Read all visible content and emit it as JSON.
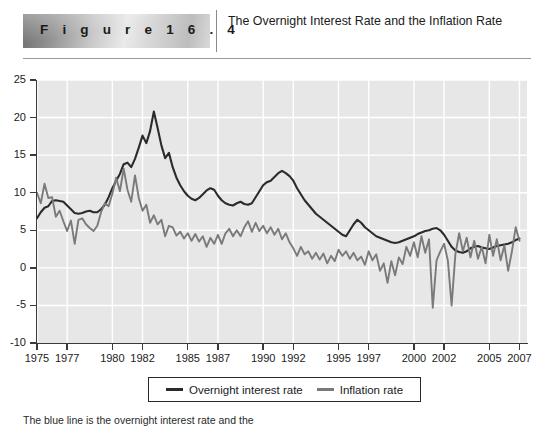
{
  "header": {
    "figure_label": "F i g u r e   1 6 . 4",
    "title": "The Overnight Interest Rate and the Inflation Rate"
  },
  "caption": "The blue line is the overnight interest rate and the",
  "legend": {
    "position": "bottom",
    "items": [
      {
        "label": "Overnight interest rate",
        "color": "#2b2b2b"
      },
      {
        "label": "Inflation rate",
        "color": "#7a7a7a"
      }
    ]
  },
  "colors": {
    "plot_background": "#e7e7e7",
    "gridline": "#ffffff",
    "axis": "#3a3a3a",
    "overnight_rate": "#2b2b2b",
    "inflation_rate": "#7a7a7a"
  },
  "chart_data": {
    "type": "line",
    "title": "The Overnight Interest Rate and the Inflation Rate",
    "xlabel": "",
    "ylabel": "",
    "xlim": [
      1975,
      2007.5
    ],
    "ylim": [
      -10,
      25
    ],
    "grid": true,
    "yticks": [
      25,
      20,
      15,
      10,
      5,
      0,
      -5,
      -10
    ],
    "ytick_labels": [
      "25",
      "20",
      "15",
      "10",
      "5",
      "0",
      "-5",
      "-10"
    ],
    "xticks": [
      1975,
      1977,
      1980,
      1982,
      1985,
      1987,
      1990,
      1992,
      1995,
      1997,
      2000,
      2002,
      2005,
      2007
    ],
    "xtick_labels": [
      "1975",
      "1977",
      "1980",
      "1982",
      "1985",
      "1987",
      "1990",
      "1992",
      "1995",
      "1997",
      "2000",
      "2002",
      "2005",
      "2007"
    ],
    "series": [
      {
        "name": "Overnight interest rate",
        "color": "#2b2b2b",
        "x": [
          1975.0,
          1975.25,
          1975.5,
          1975.75,
          1976.0,
          1976.25,
          1976.5,
          1976.75,
          1977.0,
          1977.25,
          1977.5,
          1977.75,
          1978.0,
          1978.25,
          1978.5,
          1978.75,
          1979.0,
          1979.25,
          1979.5,
          1979.75,
          1980.0,
          1980.25,
          1980.5,
          1980.75,
          1981.0,
          1981.25,
          1981.5,
          1981.75,
          1982.0,
          1982.25,
          1982.5,
          1982.75,
          1983.0,
          1983.25,
          1983.5,
          1983.75,
          1984.0,
          1984.25,
          1984.5,
          1984.75,
          1985.0,
          1985.25,
          1985.5,
          1985.75,
          1986.0,
          1986.25,
          1986.5,
          1986.75,
          1987.0,
          1987.25,
          1987.5,
          1987.75,
          1988.0,
          1988.25,
          1988.5,
          1988.75,
          1989.0,
          1989.25,
          1989.5,
          1989.75,
          1990.0,
          1990.25,
          1990.5,
          1990.75,
          1991.0,
          1991.25,
          1991.5,
          1991.75,
          1992.0,
          1992.25,
          1992.5,
          1992.75,
          1993.0,
          1993.25,
          1993.5,
          1993.75,
          1994.0,
          1994.25,
          1994.5,
          1994.75,
          1995.0,
          1995.25,
          1995.5,
          1995.75,
          1996.0,
          1996.25,
          1996.5,
          1996.75,
          1997.0,
          1997.25,
          1997.5,
          1997.75,
          1998.0,
          1998.25,
          1998.5,
          1998.75,
          1999.0,
          1999.25,
          1999.5,
          1999.75,
          2000.0,
          2000.25,
          2000.5,
          2000.75,
          2001.0,
          2001.25,
          2001.5,
          2001.75,
          2002.0,
          2002.25,
          2002.5,
          2002.75,
          2003.0,
          2003.25,
          2003.5,
          2003.75,
          2004.0,
          2004.25,
          2004.5,
          2004.75,
          2005.0,
          2005.25,
          2005.5,
          2005.75,
          2006.0,
          2006.25,
          2006.5,
          2006.75,
          2007.0
        ],
        "y": [
          6.6,
          7.4,
          8.0,
          8.2,
          8.9,
          9.0,
          8.9,
          8.8,
          8.3,
          7.8,
          7.3,
          7.2,
          7.3,
          7.5,
          7.6,
          7.4,
          7.4,
          7.8,
          8.4,
          9.4,
          10.6,
          11.6,
          12.5,
          13.8,
          14.0,
          13.4,
          14.5,
          16.0,
          17.6,
          16.6,
          18.2,
          20.8,
          18.6,
          16.3,
          14.6,
          15.3,
          13.4,
          12.0,
          11.0,
          10.2,
          9.6,
          9.2,
          9.0,
          9.3,
          9.8,
          10.3,
          10.6,
          10.4,
          9.6,
          9.0,
          8.6,
          8.4,
          8.3,
          8.6,
          8.8,
          8.5,
          8.4,
          8.6,
          9.4,
          10.2,
          11.0,
          11.4,
          11.6,
          12.1,
          12.6,
          12.9,
          12.6,
          12.2,
          11.6,
          10.6,
          9.8,
          9.0,
          8.4,
          7.8,
          7.2,
          6.8,
          6.4,
          6.0,
          5.6,
          5.2,
          4.8,
          4.4,
          4.2,
          5.0,
          5.8,
          6.4,
          6.0,
          5.4,
          5.0,
          4.6,
          4.2,
          4.0,
          3.8,
          3.6,
          3.4,
          3.3,
          3.4,
          3.6,
          3.8,
          4.0,
          4.2,
          4.5,
          4.7,
          4.9,
          5.0,
          5.2,
          5.3,
          5.0,
          4.4,
          3.6,
          2.8,
          2.3,
          2.1,
          2.0,
          2.2,
          2.6,
          2.8,
          2.9,
          2.7,
          2.6,
          2.5,
          2.7,
          2.9,
          3.0,
          3.1,
          3.2,
          3.4,
          3.7,
          3.9
        ]
      },
      {
        "name": "Inflation rate",
        "color": "#7a7a7a",
        "x": [
          1975.0,
          1975.25,
          1975.5,
          1975.75,
          1976.0,
          1976.25,
          1976.5,
          1976.75,
          1977.0,
          1977.25,
          1977.5,
          1977.75,
          1978.0,
          1978.25,
          1978.5,
          1978.75,
          1979.0,
          1979.25,
          1979.5,
          1979.75,
          1980.0,
          1980.25,
          1980.5,
          1980.75,
          1981.0,
          1981.25,
          1981.5,
          1981.75,
          1982.0,
          1982.25,
          1982.5,
          1982.75,
          1983.0,
          1983.25,
          1983.5,
          1983.75,
          1984.0,
          1984.25,
          1984.5,
          1984.75,
          1985.0,
          1985.25,
          1985.5,
          1985.75,
          1986.0,
          1986.25,
          1986.5,
          1986.75,
          1987.0,
          1987.25,
          1987.5,
          1987.75,
          1988.0,
          1988.25,
          1988.5,
          1988.75,
          1989.0,
          1989.25,
          1989.5,
          1989.75,
          1990.0,
          1990.25,
          1990.5,
          1990.75,
          1991.0,
          1991.25,
          1991.5,
          1991.75,
          1992.0,
          1992.25,
          1992.5,
          1992.75,
          1993.0,
          1993.25,
          1993.5,
          1993.75,
          1994.0,
          1994.25,
          1994.5,
          1994.75,
          1995.0,
          1995.25,
          1995.5,
          1995.75,
          1996.0,
          1996.25,
          1996.5,
          1996.75,
          1997.0,
          1997.25,
          1997.5,
          1997.75,
          1998.0,
          1998.25,
          1998.5,
          1998.75,
          1999.0,
          1999.25,
          1999.5,
          1999.75,
          2000.0,
          2000.25,
          2000.5,
          2000.75,
          2001.0,
          2001.25,
          2001.5,
          2001.75,
          2002.0,
          2002.25,
          2002.5,
          2002.75,
          2003.0,
          2003.25,
          2003.5,
          2003.75,
          2004.0,
          2004.25,
          2004.5,
          2004.75,
          2005.0,
          2005.25,
          2005.5,
          2005.75,
          2006.0,
          2006.25,
          2006.5,
          2006.75,
          2007.0
        ],
        "y": [
          10.0,
          8.6,
          11.2,
          9.3,
          9.4,
          6.8,
          7.6,
          6.2,
          4.9,
          6.3,
          3.2,
          6.4,
          6.6,
          5.8,
          5.3,
          4.9,
          5.6,
          7.4,
          8.6,
          8.2,
          9.9,
          12.0,
          10.2,
          13.2,
          10.4,
          8.8,
          12.3,
          9.3,
          7.6,
          8.4,
          6.0,
          7.0,
          5.8,
          6.4,
          4.2,
          5.6,
          5.4,
          4.3,
          4.8,
          3.9,
          4.6,
          3.6,
          4.5,
          3.5,
          4.2,
          2.8,
          4.0,
          3.2,
          4.4,
          3.2,
          4.6,
          5.2,
          4.2,
          5.0,
          4.2,
          5.4,
          6.2,
          4.8,
          6.0,
          4.9,
          5.6,
          4.6,
          5.4,
          4.4,
          5.2,
          3.8,
          4.6,
          3.4,
          2.6,
          1.6,
          2.8,
          1.8,
          2.2,
          1.2,
          2.0,
          1.1,
          1.9,
          0.6,
          1.6,
          0.9,
          2.4,
          1.6,
          2.2,
          1.2,
          2.0,
          1.0,
          1.5,
          0.4,
          2.2,
          1.0,
          1.8,
          -0.4,
          0.6,
          -2.0,
          0.9,
          -1.0,
          1.4,
          0.5,
          2.8,
          1.6,
          3.4,
          1.4,
          4.2,
          2.0,
          3.8,
          -5.3,
          1.0,
          2.2,
          3.2,
          1.0,
          -5.0,
          1.8,
          4.6,
          2.2,
          4.0,
          1.4,
          3.6,
          1.2,
          2.8,
          0.6,
          4.4,
          1.6,
          3.8,
          1.0,
          3.0,
          -0.4,
          2.2,
          5.4,
          3.6
        ]
      }
    ]
  }
}
